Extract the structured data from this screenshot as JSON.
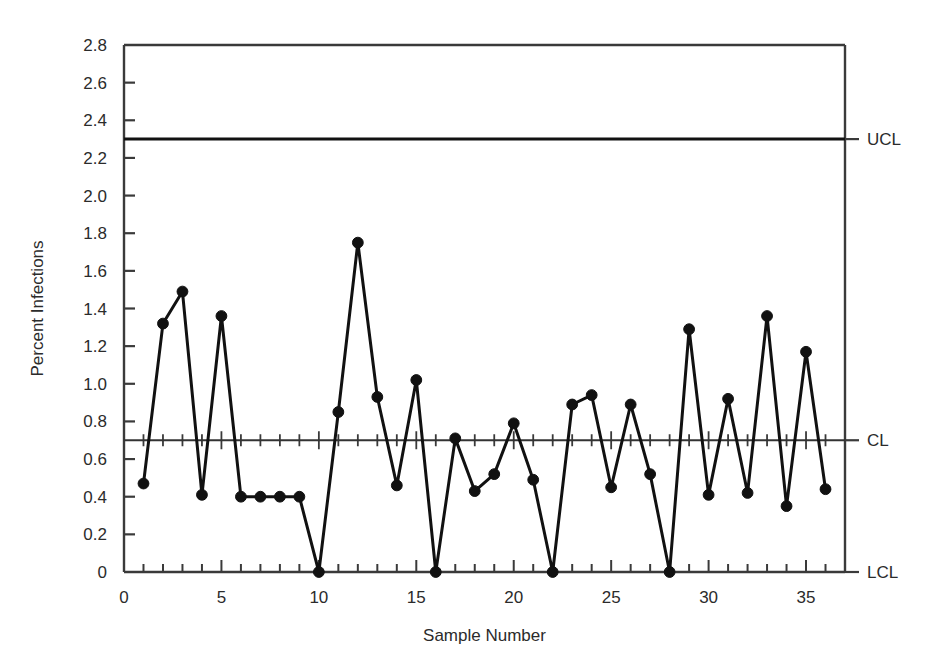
{
  "chart_data": {
    "type": "line",
    "title": "",
    "subtitle": "",
    "xlabel": "Sample Number",
    "ylabel": "Percent Infections",
    "xlim": [
      0,
      37
    ],
    "ylim": [
      0,
      2.8
    ],
    "grid": false,
    "legend": null,
    "x": [
      1,
      2,
      3,
      4,
      5,
      6,
      7,
      8,
      9,
      10,
      11,
      12,
      13,
      14,
      15,
      16,
      17,
      18,
      19,
      20,
      21,
      22,
      23,
      24,
      25,
      26,
      27,
      28,
      29,
      30,
      31,
      32,
      33,
      34,
      35,
      36
    ],
    "values": [
      0.47,
      1.32,
      1.49,
      0.41,
      1.36,
      0.4,
      0.4,
      0.4,
      0.4,
      0.0,
      0.85,
      1.75,
      0.93,
      0.46,
      1.02,
      0.0,
      0.71,
      0.43,
      0.52,
      0.79,
      0.49,
      0.0,
      0.89,
      0.94,
      0.45,
      0.89,
      0.52,
      0.0,
      1.29,
      0.41,
      0.92,
      0.42,
      1.36,
      0.35,
      1.17,
      0.44
    ],
    "series": [
      {
        "name": "Percent Infections",
        "values": [
          0.47,
          1.32,
          1.49,
          0.41,
          1.36,
          0.4,
          0.4,
          0.4,
          0.4,
          0.0,
          0.85,
          1.75,
          0.93,
          0.46,
          1.02,
          0.0,
          0.71,
          0.43,
          0.52,
          0.79,
          0.49,
          0.0,
          0.89,
          0.94,
          0.45,
          0.89,
          0.52,
          0.0,
          1.29,
          0.41,
          0.92,
          0.42,
          1.36,
          0.35,
          1.17,
          0.44
        ]
      }
    ],
    "control_limits": {
      "ucl": 2.3,
      "cl": 0.7,
      "lcl": 0.0
    },
    "y_ticks": [
      "0",
      "0.2",
      "0.4",
      "0.6",
      "0.8",
      "1.0",
      "1.2",
      "1.4",
      "1.6",
      "1.8",
      "2.0",
      "2.2",
      "2.4",
      "2.6",
      "2.8"
    ],
    "y_tick_values": [
      0,
      0.2,
      0.4,
      0.6,
      0.8,
      1.0,
      1.2,
      1.4,
      1.6,
      1.8,
      2.0,
      2.2,
      2.4,
      2.6,
      2.8
    ],
    "x_ticks": [
      "0",
      "5",
      "10",
      "15",
      "20",
      "25",
      "30",
      "35"
    ],
    "x_tick_values": [
      0,
      5,
      10,
      15,
      20,
      25,
      30,
      35
    ],
    "x_minor_step": 1,
    "marker": "filled-circle",
    "line_color": "#111111",
    "marker_color": "#111111",
    "axis_color": "#3a3a3a"
  },
  "labels": {
    "ucl": "UCL",
    "cl": "CL",
    "lcl": "LCL"
  }
}
